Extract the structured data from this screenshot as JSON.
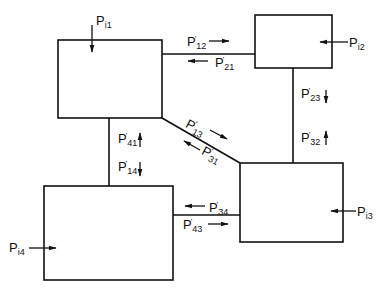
{
  "diagram": {
    "type": "power-flow network (four subsystems)",
    "line_color": "#111111",
    "background": "#ffffff",
    "nodes": [
      {
        "id": "1",
        "input_label": "P",
        "input_sub": "i1",
        "input_direction": "down"
      },
      {
        "id": "2",
        "input_label": "P",
        "input_sub": "i2",
        "input_direction": "left"
      },
      {
        "id": "3",
        "input_label": "P",
        "input_sub": "i3",
        "input_direction": "left"
      },
      {
        "id": "4",
        "input_label": "P",
        "input_sub": "i4",
        "input_direction": "right"
      }
    ],
    "flows": [
      {
        "from": "1",
        "to": "2",
        "label": "P",
        "prime": "'",
        "sub": "12",
        "direction": "right"
      },
      {
        "from": "2",
        "to": "1",
        "label": "P",
        "prime": "'",
        "sub": "21",
        "direction": "left"
      },
      {
        "from": "2",
        "to": "3",
        "label": "P",
        "prime": "'",
        "sub": "23",
        "direction": "down"
      },
      {
        "from": "3",
        "to": "2",
        "label": "P",
        "prime": "'",
        "sub": "32",
        "direction": "up"
      },
      {
        "from": "1",
        "to": "3",
        "label": "P",
        "prime": "'",
        "sub": "13",
        "direction": "down-right"
      },
      {
        "from": "3",
        "to": "1",
        "label": "P",
        "prime": "'",
        "sub": "31",
        "direction": "up-left"
      },
      {
        "from": "4",
        "to": "1",
        "label": "P",
        "prime": "'",
        "sub": "41",
        "direction": "up"
      },
      {
        "from": "1",
        "to": "4",
        "label": "P",
        "prime": "'",
        "sub": "14",
        "direction": "down"
      },
      {
        "from": "3",
        "to": "4",
        "label": "P",
        "prime": "'",
        "sub": "34",
        "direction": "left"
      },
      {
        "from": "4",
        "to": "3",
        "label": "P",
        "prime": "'",
        "sub": "43",
        "direction": "right"
      }
    ]
  }
}
